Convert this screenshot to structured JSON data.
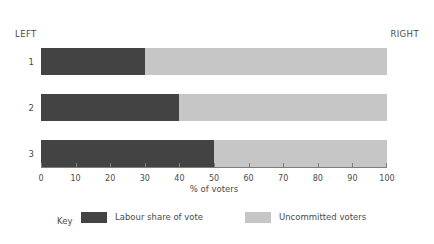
{
  "chart_data": {
    "type": "bar",
    "orientation": "horizontal",
    "stacked": true,
    "title": "",
    "xlabel": "% of voters",
    "ylabel": "",
    "xlim": [
      0,
      100
    ],
    "ylim": null,
    "grid": false,
    "legend_position": "bottom",
    "categories": [
      "1",
      "2",
      "3"
    ],
    "x_ticks": [
      0,
      10,
      20,
      30,
      40,
      50,
      60,
      70,
      80,
      90,
      100
    ],
    "x_tick_labels": [
      "0",
      "10",
      "20",
      "30",
      "40",
      "50",
      "60",
      "70",
      "80",
      "90",
      "100"
    ],
    "series": [
      {
        "name": "Labour share of vote",
        "color": "#434343",
        "values": [
          30,
          40,
          50
        ]
      },
      {
        "name": "Uncommitted voters",
        "color": "#c6c6c6",
        "values": [
          70,
          60,
          50
        ]
      }
    ],
    "annotations": {
      "left_pole": "LEFT",
      "right_pole": "RIGHT"
    }
  },
  "poles": {
    "left": "LEFT",
    "right": "RIGHT"
  },
  "axis": {
    "title": "% of voters",
    "ticks": [
      "0",
      "10",
      "20",
      "30",
      "40",
      "50",
      "60",
      "70",
      "80",
      "90",
      "100"
    ]
  },
  "rows": [
    {
      "label": "1",
      "primary": 30,
      "secondary": 70
    },
    {
      "label": "2",
      "primary": 40,
      "secondary": 60
    },
    {
      "label": "3",
      "primary": 50,
      "secondary": 50
    }
  ],
  "legend": {
    "title": "Key",
    "entries": [
      {
        "label": "Labour share of vote",
        "color": "#434343"
      },
      {
        "label": "Uncommitted voters",
        "color": "#c6c6c6"
      }
    ]
  },
  "colors": {
    "primary": "#434343",
    "secondary": "#c6c6c6",
    "axis": "#7d7d7d",
    "text": "#4a4a4a",
    "background": "#ffffff"
  }
}
